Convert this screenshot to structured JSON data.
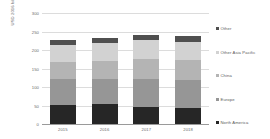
{
  "chart_data": {
    "type": "bar",
    "stacked": true,
    "title": "",
    "xlabel": "",
    "ylabel": "USD 2016 billion",
    "ylim": [
      0,
      300
    ],
    "yticks": [
      0,
      50,
      100,
      150,
      200,
      250,
      300
    ],
    "ytick_labels": [
      "0",
      "50",
      "100",
      "150",
      "200",
      "250",
      "300"
    ],
    "grid": true,
    "legend_position": "right",
    "categories": [
      "2015",
      "2016",
      "2017",
      "2018"
    ],
    "series": [
      {
        "name": "North America",
        "values": [
          52,
          53,
          45,
          43
        ],
        "color": "#262626"
      },
      {
        "name": "Europe",
        "values": [
          70,
          68,
          78,
          76
        ],
        "color": "#969696"
      },
      {
        "name": "China",
        "values": [
          47,
          50,
          53,
          54
        ],
        "color": "#b4b4b4"
      },
      {
        "name": "Other Asia Pacific",
        "values": [
          45,
          47,
          50,
          50
        ],
        "color": "#d2d2d2"
      },
      {
        "name": "Other",
        "values": [
          14,
          14,
          14,
          14
        ],
        "color": "#4f4f4f"
      }
    ],
    "totals": [
      228,
      232,
      240,
      237
    ]
  },
  "legend": {
    "items": [
      {
        "label": "Other"
      },
      {
        "label": "Other Asia Pacific"
      },
      {
        "label": "China"
      },
      {
        "label": "Europe"
      },
      {
        "label": "North America"
      }
    ]
  },
  "colors": {
    "gridline": "#dcdcdc",
    "axis": "#9a9a9a",
    "text": "#6b6b6b",
    "background": "#ffffff"
  }
}
